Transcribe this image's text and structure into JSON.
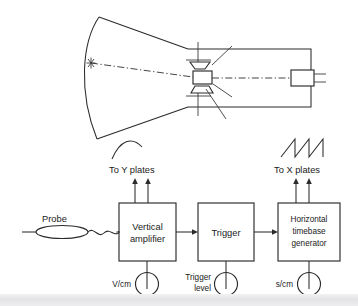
{
  "figure": {
    "background_color": "#ffffff",
    "line_color": "#2b2b2b",
    "text_color": "#1a1a1a"
  },
  "crt": {
    "screen_spot_label": "*",
    "parts": {
      "screen": "curved-crt-screen-face",
      "funnel": "crt-funnel-envelope",
      "tube_body": "crt-neck-body",
      "y_plates": "y-deflection-plates",
      "x_plates": "x-deflection-plates",
      "electron_beam": "electron-beam-axis",
      "cathode": "cathode-heater-assembly"
    }
  },
  "waveforms": {
    "y_signal": {
      "name": "sine-like-vertical-signal",
      "points": "0,18 8,6 18,2 30,8 40,18"
    },
    "x_signal": {
      "name": "sawtooth-timebase-signal",
      "ramps": 3
    }
  },
  "labels": {
    "to_y_plates": "To Y  plates",
    "to_x_plates": "To X  plates",
    "probe": "Probe"
  },
  "blocks": [
    {
      "id": "vertical-amplifier",
      "lines": [
        "Vertical",
        "amplifier"
      ],
      "knob": {
        "label": "V/cm",
        "name": "volts-per-cm-knob"
      }
    },
    {
      "id": "trigger",
      "lines": [
        "Trigger"
      ],
      "knob": {
        "label": "Trigger\nlevel",
        "label_line1": "Trigger",
        "label_line2": "level",
        "name": "trigger-level-knob"
      }
    },
    {
      "id": "horizontal-timebase-generator",
      "lines": [
        "Horizontal",
        "timebase",
        "generator"
      ],
      "knob": {
        "label": "s/cm",
        "name": "seconds-per-cm-knob"
      }
    }
  ]
}
